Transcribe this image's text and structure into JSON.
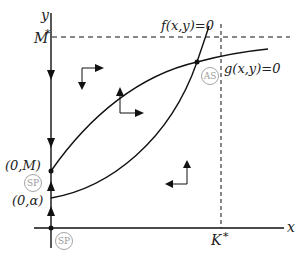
{
  "diagram": {
    "type": "phase-plane",
    "axes": {
      "x_label": "x",
      "y_label": "y"
    },
    "levels": {
      "M_star_label": "M",
      "M_star_sup": "*",
      "K_star_label": "K",
      "K_star_sup": "*"
    },
    "curves": {
      "f_label": "f(x,y)=0",
      "g_label": "g(x,y)=0"
    },
    "points": {
      "zero_M": "(0,M)",
      "zero_alpha": "(0,α)",
      "AS": "AS",
      "SP_axis": "SP",
      "SP_origin": "SP"
    },
    "colors": {
      "line": "#111111",
      "badge": "#9a9a9a"
    }
  }
}
